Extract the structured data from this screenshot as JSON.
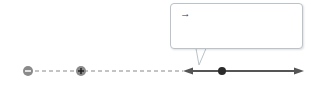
{
  "callout": {
    "line1_vec1": "E",
    "line1_sub1": "1",
    "line1_text": " is smaller than ",
    "line1_vec2": "E",
    "line1_sub2": "2",
    "line2": "because particle 1 is farther",
    "line3": "away than particle 2."
  },
  "particles": [
    {
      "label": "1",
      "sign": "−",
      "color": "#8a8a8a"
    },
    {
      "label": "2",
      "sign": "+",
      "color": "#8a8a8a"
    }
  ],
  "point": {
    "label": "A",
    "color": "#2b2b2b"
  },
  "vectors": [
    {
      "name": "E",
      "sub": "1",
      "direction": "left"
    },
    {
      "name": "E",
      "sub": "2",
      "direction": "right"
    }
  ],
  "colors": {
    "line": "#555555",
    "dashed": "#888888",
    "callout_border": "#b9c3c9"
  }
}
